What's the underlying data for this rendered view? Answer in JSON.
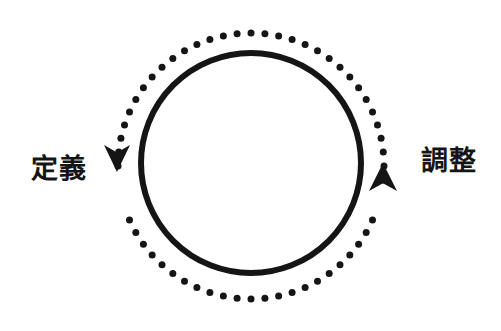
{
  "diagram": {
    "type": "cycle",
    "title": "",
    "background_color": "#ffffff",
    "ink_color": "#151515",
    "inner_ring": {
      "name": "solid-circle",
      "style": "solid",
      "center_x": 251,
      "center_y": 163,
      "radius": 110,
      "stroke_width": 6,
      "color": "#151515"
    },
    "outer_ring": {
      "name": "dotted-circle",
      "style": "dotted",
      "center_x": 251,
      "center_y": 166,
      "radius": 133,
      "dot_diameter": 7,
      "dot_count": 60,
      "color": "#151515"
    },
    "arrows": [
      {
        "id": "arrow-define",
        "direction": "up",
        "angle_deg": 193,
        "tip_x": 117,
        "tip_y": 172,
        "width": 26,
        "length": 27,
        "color": "#151515"
      },
      {
        "id": "arrow-adjust",
        "direction": "down",
        "angle_deg": 348,
        "tip_x": 383,
        "tip_y": 163,
        "width": 28,
        "length": 28,
        "color": "#151515"
      }
    ],
    "labels": {
      "left": "定義",
      "right": "調整"
    }
  }
}
